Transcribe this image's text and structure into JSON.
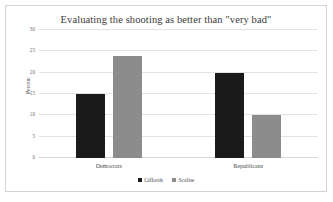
{
  "chart_data": {
    "type": "bar",
    "title": "Evaluating the shooting as better than \"very bad\"",
    "xlabel": "",
    "ylabel": "Percent",
    "categories": [
      "Democrats",
      "Republicans"
    ],
    "series": [
      {
        "name": "Giffords",
        "values": [
          15,
          20
        ],
        "color": "#1a1a1a"
      },
      {
        "name": "Scalise",
        "values": [
          24,
          10
        ],
        "color": "#8c8c8c"
      }
    ],
    "ylim": [
      0,
      30
    ],
    "yticks": [
      0,
      5,
      10,
      15,
      20,
      25,
      30
    ],
    "ytick_labels": [
      "0",
      "5",
      "10",
      "15",
      "20",
      "25",
      "30"
    ],
    "grid": true,
    "legend_position": "bottom",
    "background_color": "#ffffff",
    "grid_color": "#e3e3e3",
    "border_color": "#d3d3d3"
  }
}
